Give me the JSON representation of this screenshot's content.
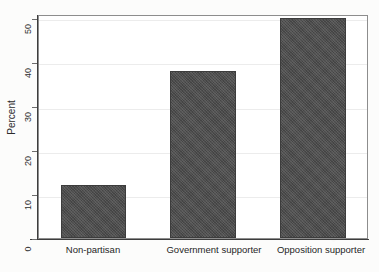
{
  "chart_data": {
    "type": "bar",
    "title": "",
    "subtitle": "",
    "xlabel": "",
    "ylabel": "Percent",
    "categories": [
      "Non-partisan",
      "Government supporter",
      "Opposition supporter"
    ],
    "values": [
      12,
      38,
      50
    ],
    "ylim": [
      0,
      50
    ],
    "yticks": [
      0,
      10,
      20,
      30,
      40,
      50
    ],
    "ytick_labels": [
      "0",
      "10",
      "20",
      "30",
      "40",
      "50"
    ],
    "grid": true,
    "grid_axis": "y",
    "legend": null,
    "legend_position": "none",
    "bar_color": "#4d4d4d",
    "background_color": "#ffffff",
    "axis_color": "#3d3d3d",
    "gridline_color": "#ececec"
  },
  "axes": {
    "y_title": "Percent",
    "ticks": [
      {
        "label": "50",
        "value": 50
      },
      {
        "label": "40",
        "value": 40
      },
      {
        "label": "30",
        "value": 30
      },
      {
        "label": "20",
        "value": 20
      },
      {
        "label": "10",
        "value": 10
      },
      {
        "label": "0",
        "value": 0
      }
    ]
  },
  "bars": [
    {
      "label": "Non-partisan",
      "value": 12
    },
    {
      "label": "Government supporter",
      "value": 38
    },
    {
      "label": "Opposition supporter",
      "value": 50
    }
  ],
  "artifacts": {
    "top_left": "",
    "top_right": ""
  }
}
